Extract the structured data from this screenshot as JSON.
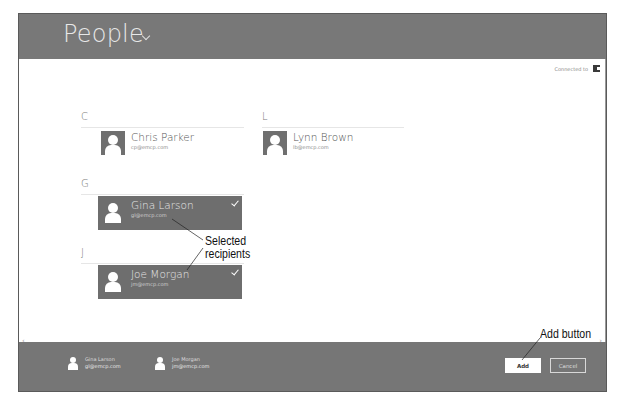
{
  "header": {
    "title": "People",
    "title_menu_icon": "chevron-down-icon",
    "connection_label": "Connected to",
    "connection_icon": "service-icon"
  },
  "groups": [
    {
      "letter": "C",
      "contacts": [
        {
          "name": "Chris Parker",
          "email": "cp@emcp.com",
          "selected": false
        }
      ]
    },
    {
      "letter": "G",
      "contacts": [
        {
          "name": "Gina Larson",
          "email": "gl@emcp.com",
          "selected": true
        }
      ]
    },
    {
      "letter": "J",
      "contacts": [
        {
          "name": "Joe Morgan",
          "email": "jm@emcp.com",
          "selected": true
        }
      ]
    },
    {
      "letter": "L",
      "contacts": [
        {
          "name": "Lynn Brown",
          "email": "lb@emcp.com",
          "selected": false
        }
      ]
    }
  ],
  "selection_tray": {
    "recipients": [
      {
        "name": "Gina Larson",
        "email": "gl@emcp.com"
      },
      {
        "name": "Joe Morgan",
        "email": "jm@emcp.com"
      }
    ],
    "add_label": "Add",
    "cancel_label": "Cancel"
  },
  "scroll": {
    "left_glyph": "‹",
    "right_glyph": "›"
  },
  "annotations": {
    "selected_recipients": "Selected\nrecipients",
    "selected_line1": "Selected",
    "selected_line2": "recipients",
    "add_button": "Add button"
  },
  "colors": {
    "header_bg": "#787878",
    "footer_bg": "#767676",
    "selected_tile_bg": "#6e6e6e",
    "avatar_bg": "#6f6f6f",
    "page_bg": "#ffffff"
  }
}
